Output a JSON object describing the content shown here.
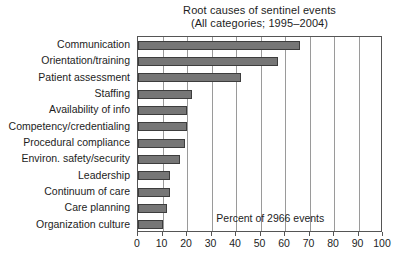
{
  "chart_data": {
    "type": "bar",
    "orientation": "horizontal",
    "title": "Root causes of sentinel events",
    "subtitle": "(All categories; 1995–2004)",
    "xlabel": "",
    "ylabel": "",
    "xlim": [
      0,
      100
    ],
    "xticks": [
      0,
      10,
      20,
      30,
      40,
      50,
      60,
      70,
      80,
      90,
      100
    ],
    "xticklabels": [
      "0",
      "10",
      "20",
      "30",
      "40",
      "50",
      "60",
      "70",
      "80",
      "90",
      "100"
    ],
    "grid": "vertical",
    "legend": "none",
    "annotations": [
      {
        "text": "Percent of 2966 events",
        "x": 54,
        "y_index": 10.6
      }
    ],
    "categories": [
      "Communication",
      "Orientation/training",
      "Patient assessment",
      "Staffing",
      "Availability of info",
      "Competency/credentialing",
      "Procedural compliance",
      "Environ. safety/security",
      "Leadership",
      "Continuum of care",
      "Care planning",
      "Organization culture"
    ],
    "values": [
      66,
      57,
      42,
      22,
      20,
      20,
      19,
      17,
      13,
      13,
      12,
      10
    ],
    "bar_color": "#767676",
    "bar_edge_color": "#3d3d3d",
    "axis_color": "#555555",
    "grid_color": "#9a9a9a",
    "text_color": "#1d1d1d"
  }
}
